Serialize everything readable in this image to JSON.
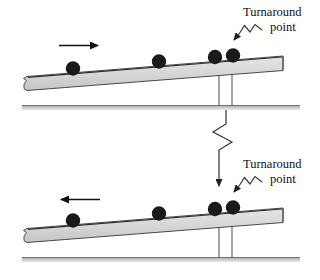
{
  "figure": {
    "panels": [
      {
        "id": "upper",
        "description": "Ball moving up the incline toward the turnaround point",
        "motion_arrow_direction": "right",
        "annotation": {
          "line1": "Turnaround",
          "line2": "point"
        },
        "ball_count": 4
      },
      {
        "id": "lower",
        "description": "Ball moving down the incline away from the turnaround point",
        "motion_arrow_direction": "left",
        "annotation": {
          "line1": "Turnaround",
          "line2": "point"
        },
        "ball_count": 4
      }
    ],
    "colors": {
      "ramp_fill": "#d9d9d9",
      "ramp_edge": "#3a3a3a",
      "ball_fill": "#1a1a1a",
      "ground_fill": "#b9b9b9",
      "post_stroke": "#555555",
      "leader_stroke": "#333333",
      "text": "#111111"
    }
  }
}
